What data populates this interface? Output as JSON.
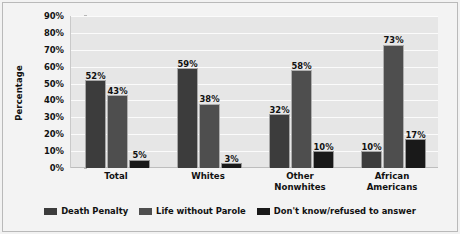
{
  "chart_data": {
    "type": "bar",
    "title": "",
    "subtitle": "",
    "xlabel": "",
    "ylabel": "Percentage",
    "ylim": [
      0,
      90
    ],
    "ytick_labels": [
      "90%",
      "80%",
      "70%",
      "60%",
      "50%",
      "40%",
      "30%",
      "20%",
      "10%",
      "0%"
    ],
    "ytick_values": [
      90,
      80,
      70,
      60,
      50,
      40,
      30,
      20,
      10,
      0
    ],
    "grid": true,
    "legend_position": "bottom-center",
    "categories": [
      "Total",
      "Whites",
      "Other Nonwhites",
      "African Americans"
    ],
    "category_lines": [
      [
        "Total"
      ],
      [
        "Whites"
      ],
      [
        "Other",
        "Nonwhites"
      ],
      [
        "African",
        "Americans"
      ]
    ],
    "series": [
      {
        "name": "Death Penalty",
        "color": "#3c3c3c",
        "values": [
          52,
          59,
          32,
          10
        ],
        "labels": [
          "52%",
          "59%",
          "32%",
          "10%"
        ]
      },
      {
        "name": "Life without Parole",
        "color": "#4e4e4e",
        "values": [
          43,
          38,
          58,
          73
        ],
        "labels": [
          "43%",
          "38%",
          "58%",
          "73%"
        ]
      },
      {
        "name": "Don't know/refused to answer",
        "color": "#191919",
        "values": [
          5,
          3,
          10,
          17
        ],
        "labels": [
          "5%",
          "3%",
          "10%",
          "17%"
        ]
      }
    ]
  },
  "colors": {
    "page_background": "#f2f2f2",
    "plot_background": "#e6e6e6",
    "gridline": "#fbfbfb",
    "frame_border": "#b9b9b9",
    "text": "#111111"
  }
}
